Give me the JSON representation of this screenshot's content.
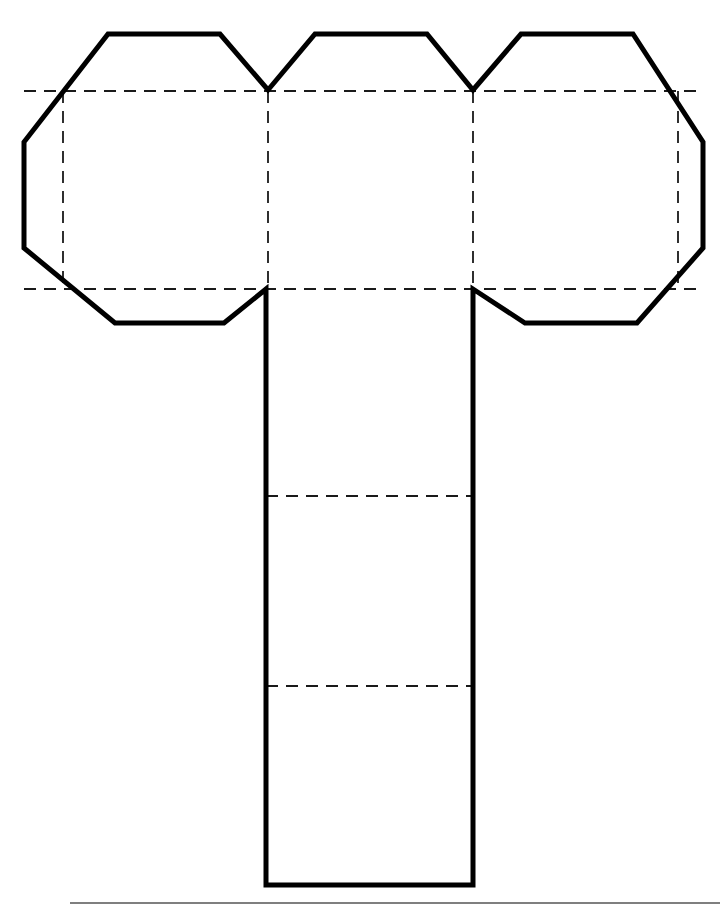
{
  "document": {
    "title": "Cube net with octagonal flaps",
    "page_background": "#ffffff",
    "width": 726,
    "height": 908
  },
  "style": {
    "cut_line_color": "#000000",
    "cut_line_width": 5,
    "fold_line_color": "#1a1a1a",
    "fold_line_width": 1.8,
    "fold_dash_pattern": "12 8",
    "panel_fill": "#ffffff",
    "footer_rule_color": "#555555"
  },
  "geometry": {
    "outline_points": "108,34 220,34 268,90 315,34 427,34 473,90 521,34 633,34 703,142 703,248 637,323 525,323 473,289 473,885 266,885 266,289 224,323 115,323 24,248 24,142",
    "fold_lines": {
      "horizontal": [
        {
          "name": "upper-fold",
          "x1": 24,
          "y1": 91,
          "x2": 703,
          "y2": 91
        },
        {
          "name": "lower-fold",
          "x1": 24,
          "y1": 289,
          "x2": 703,
          "y2": 289
        },
        {
          "name": "stem-fold-upper",
          "x1": 266,
          "y1": 496,
          "x2": 473,
          "y2": 496
        },
        {
          "name": "stem-fold-lower",
          "x1": 266,
          "y1": 686,
          "x2": 473,
          "y2": 686
        }
      ],
      "vertical": [
        {
          "name": "left-panel-fold",
          "x1": 63,
          "y1": 91,
          "x2": 63,
          "y2": 289
        },
        {
          "name": "center-left-fold",
          "x1": 268,
          "y1": 91,
          "x2": 268,
          "y2": 289
        },
        {
          "name": "center-right-fold",
          "x1": 473,
          "y1": 91,
          "x2": 473,
          "y2": 289
        },
        {
          "name": "right-panel-fold",
          "x1": 678,
          "y1": 91,
          "x2": 678,
          "y2": 289
        }
      ]
    },
    "footer_rule": {
      "x1": 70,
      "y1": 903,
      "x2": 720,
      "y2": 903
    }
  },
  "panels": [
    {
      "name": "left-end-flap",
      "x": 24,
      "y": 91,
      "width": 39,
      "height": 198
    },
    {
      "name": "face-left",
      "x": 63,
      "y": 91,
      "width": 205,
      "height": 198
    },
    {
      "name": "face-center",
      "x": 268,
      "y": 91,
      "width": 205,
      "height": 198
    },
    {
      "name": "face-right",
      "x": 473,
      "y": 91,
      "width": 205,
      "height": 198
    },
    {
      "name": "right-end-flap",
      "x": 678,
      "y": 91,
      "width": 25,
      "height": 198
    },
    {
      "name": "stem-upper",
      "x": 266,
      "y": 289,
      "width": 207,
      "height": 207
    },
    {
      "name": "stem-middle",
      "x": 266,
      "y": 496,
      "width": 207,
      "height": 190
    },
    {
      "name": "stem-lower",
      "x": 266,
      "y": 686,
      "width": 207,
      "height": 199
    }
  ]
}
